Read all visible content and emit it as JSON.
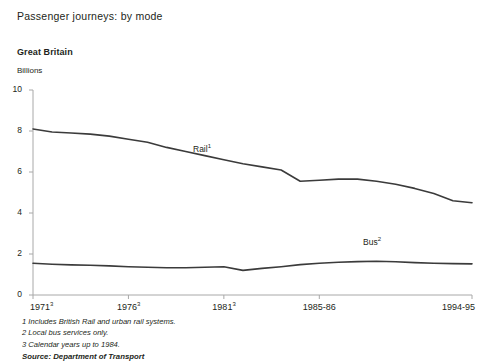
{
  "header": {
    "title": "Passenger journeys: by mode",
    "region": "Great Britain",
    "unit": "Billions"
  },
  "footnotes": {
    "note1": "1 Includes British Rail and urban rail systems.",
    "note2": "2 Local bus services only.",
    "note3": "3 Calendar years up to 1984.",
    "source": "Source: Department of Transport"
  },
  "labels": {
    "rail": "Rail",
    "rail_sup": "1",
    "bus": "Bus",
    "bus_sup": "2"
  },
  "colors": {
    "line": "#3b3b3b",
    "axis": "#a8a8a8",
    "text": "#231f20",
    "background": "#ffffff"
  },
  "chart_data": {
    "type": "line",
    "title": "Passenger journeys: by mode",
    "subtitle": "Great Britain",
    "xlabel": "",
    "ylabel": "Billions",
    "ylim": [
      0,
      10
    ],
    "yticks": [
      0,
      2,
      4,
      6,
      8,
      10
    ],
    "ytick_labels": [
      "0",
      "2",
      "4",
      "6",
      "8",
      "10"
    ],
    "grid": false,
    "legend": "inline-annotation",
    "xtick_labels": [
      "1971",
      "1976",
      "1981",
      "1985-86",
      "1994-95"
    ],
    "xtick_superscripts": [
      "3",
      "3",
      "3",
      "",
      ""
    ],
    "xtick_positions": [
      0,
      5,
      10,
      15,
      23
    ],
    "x": [
      0,
      1,
      2,
      3,
      4,
      5,
      6,
      7,
      8,
      9,
      10,
      11,
      12,
      13,
      14,
      15,
      16,
      17,
      18,
      19,
      20,
      21,
      22,
      23
    ],
    "x_labels": [
      "1971",
      "1972",
      "1973",
      "1974",
      "1975",
      "1976",
      "1977",
      "1978",
      "1979",
      "1980",
      "1981",
      "1982",
      "1983",
      "1984",
      "1985-86",
      "1986-87",
      "1987-88",
      "1988-89",
      "1989-90",
      "1990-91",
      "1991-92",
      "1992-93",
      "1993-94",
      "1994-95"
    ],
    "series": [
      {
        "name": "Rail",
        "values": [
          8.1,
          7.95,
          7.9,
          7.85,
          7.75,
          7.6,
          7.45,
          7.2,
          7.0,
          6.8,
          6.6,
          6.4,
          6.25,
          6.1,
          5.55,
          5.6,
          5.65,
          5.65,
          5.55,
          5.4,
          5.2,
          4.95,
          4.6,
          4.5
        ]
      },
      {
        "name": "Bus",
        "values": [
          1.55,
          1.5,
          1.47,
          1.45,
          1.42,
          1.38,
          1.35,
          1.33,
          1.33,
          1.35,
          1.38,
          1.2,
          1.3,
          1.38,
          1.48,
          1.55,
          1.6,
          1.63,
          1.65,
          1.62,
          1.58,
          1.55,
          1.53,
          1.52
        ]
      }
    ]
  }
}
